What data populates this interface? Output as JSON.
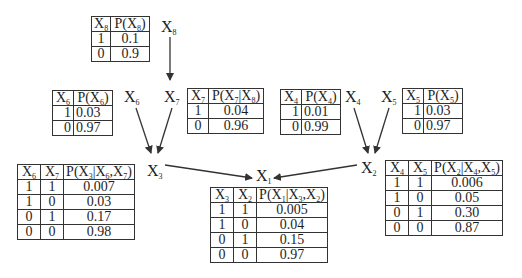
{
  "diagram": {
    "type": "bayesian-network",
    "nodes": [
      {
        "id": "X8",
        "label": "X",
        "sub": "8"
      },
      {
        "id": "X7",
        "label": "X",
        "sub": "7"
      },
      {
        "id": "X6",
        "label": "X",
        "sub": "6"
      },
      {
        "id": "X4",
        "label": "X",
        "sub": "4"
      },
      {
        "id": "X5",
        "label": "X",
        "sub": "5"
      },
      {
        "id": "X3",
        "label": "X",
        "sub": "3"
      },
      {
        "id": "X2",
        "label": "X",
        "sub": "2"
      },
      {
        "id": "X1",
        "label": "X",
        "sub": "1"
      }
    ],
    "edges": [
      {
        "from": "X8",
        "to": "X7"
      },
      {
        "from": "X6",
        "to": "X3"
      },
      {
        "from": "X7",
        "to": "X3"
      },
      {
        "from": "X4",
        "to": "X2"
      },
      {
        "from": "X5",
        "to": "X2"
      },
      {
        "from": "X3",
        "to": "X1"
      },
      {
        "from": "X2",
        "to": "X1"
      }
    ],
    "edge_color": "#333333"
  },
  "tables": {
    "x8": {
      "headers": [
        "X8",
        "P(X8)"
      ],
      "rows": [
        [
          "1",
          "0.1"
        ],
        [
          "0",
          "0.9"
        ]
      ]
    },
    "x6": {
      "headers": [
        "X6",
        "P(X6)"
      ],
      "rows": [
        [
          "1",
          "0.03"
        ],
        [
          "0",
          "0.97"
        ]
      ]
    },
    "x7": {
      "headers": [
        "X7",
        "P(X7|X8)"
      ],
      "rows": [
        [
          "1",
          "0.04"
        ],
        [
          "0",
          "0.96"
        ]
      ]
    },
    "x4": {
      "headers": [
        "X4",
        "P(X4)"
      ],
      "rows": [
        [
          "1",
          "0.01"
        ],
        [
          "0",
          "0.99"
        ]
      ]
    },
    "x5": {
      "headers": [
        "X5",
        "P(X5)"
      ],
      "rows": [
        [
          "1",
          "0.03"
        ],
        [
          "0",
          "0.97"
        ]
      ]
    },
    "x3": {
      "headers": [
        "X6",
        "X7",
        "P(X3|X6,X7)"
      ],
      "rows": [
        [
          "1",
          "1",
          "0.007"
        ],
        [
          "1",
          "0",
          "0.03"
        ],
        [
          "0",
          "1",
          "0.17"
        ],
        [
          "0",
          "0",
          "0.98"
        ]
      ]
    },
    "x1": {
      "headers": [
        "X3",
        "X2",
        "P(X1|X3,X2)"
      ],
      "rows": [
        [
          "1",
          "1",
          "0.005"
        ],
        [
          "1",
          "0",
          "0.04"
        ],
        [
          "0",
          "1",
          "0.15"
        ],
        [
          "0",
          "0",
          "0.97"
        ]
      ]
    },
    "x2": {
      "headers": [
        "X4",
        "X5",
        "P(X2|X4,X5)"
      ],
      "rows": [
        [
          "1",
          "1",
          "0.006"
        ],
        [
          "1",
          "0",
          "0.05"
        ],
        [
          "0",
          "1",
          "0.30"
        ],
        [
          "0",
          "0",
          "0.87"
        ]
      ]
    }
  }
}
